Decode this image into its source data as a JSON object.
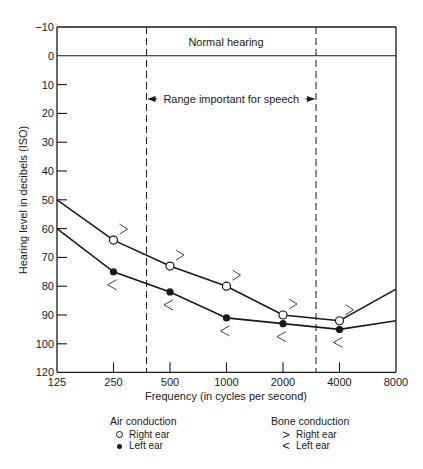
{
  "chart_data": {
    "type": "line",
    "title": "",
    "xlabel": "Frequency (in cycles per second)",
    "ylabel": "Hearing level in decibels (ISO)",
    "x": [
      125,
      250,
      500,
      1000,
      2000,
      4000,
      8000
    ],
    "x_tick_labels": [
      "125",
      "250",
      "500",
      "1000",
      "2000",
      "4000",
      "8000"
    ],
    "y_tick_labels": [
      "-10",
      "0",
      "10",
      "20",
      "30",
      "40",
      "50",
      "60",
      "70",
      "80",
      "90",
      "100",
      "120"
    ],
    "y_inverted": true,
    "ylim": [
      -10,
      120
    ],
    "grid": false,
    "series": [
      {
        "name": "Air conduction - Right ear",
        "marker": "open-circle",
        "values": [
          50,
          64,
          73,
          80,
          90,
          92,
          81
        ]
      },
      {
        "name": "Air conduction - Left ear",
        "marker": "filled-circle",
        "values": [
          60,
          75,
          82,
          91,
          93,
          95,
          92
        ]
      }
    ],
    "bone_conduction_markers": {
      "right_ear": {
        "symbol": ">",
        "x": [
          250,
          500,
          1000,
          2000,
          4000
        ]
      },
      "left_ear": {
        "symbol": "<",
        "x": [
          250,
          500,
          1000,
          2000,
          4000
        ]
      }
    },
    "annotations": [
      {
        "text": "Normal hearing",
        "region": "-10 to 0 dB band"
      },
      {
        "text": "Range important for speech",
        "x_range": [
          375,
          3000
        ]
      }
    ],
    "legend": {
      "position": "bottom",
      "groups": [
        {
          "title": "Air conduction",
          "items": [
            {
              "symbol": "O",
              "label": "Right ear"
            },
            {
              "symbol": "•",
              "label": "Left ear"
            }
          ]
        },
        {
          "title": "Bone conduction",
          "items": [
            {
              "symbol": ">",
              "label": "Right ear"
            },
            {
              "symbol": "<",
              "label": "Left ear"
            }
          ]
        }
      ]
    }
  },
  "labels": {
    "normal_hearing": "Normal hearing",
    "speech_range": "Range important for speech",
    "xlabel": "Frequency (in cycles per second)",
    "ylabel": "Hearing level in decibels (ISO)"
  },
  "legend": {
    "air": {
      "title": "Air conduction",
      "right": "Right ear",
      "left": "Left ear"
    },
    "bone": {
      "title": "Bone conduction",
      "right_symbol": ">",
      "right": "Right ear",
      "left_symbol": "<",
      "left": "Left ear"
    }
  }
}
